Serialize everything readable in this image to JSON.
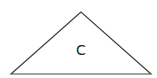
{
  "diagram": {
    "shape": "triangle",
    "label": "C",
    "stroke_color": "#444444",
    "fill_color": "#ffffff",
    "vertices": [
      [
        81,
        12
      ],
      [
        11,
        74
      ],
      [
        151,
        74
      ]
    ]
  }
}
